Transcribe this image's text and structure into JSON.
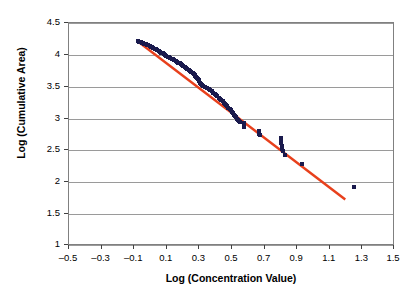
{
  "chart_data": {
    "type": "scatter",
    "title": "",
    "xlabel": "Log (Concentration Value)",
    "ylabel": "Log (Cumulative Area)",
    "xlim": [
      -0.5,
      1.5
    ],
    "ylim": [
      1,
      4.5
    ],
    "xticks": [
      "-0.5",
      "-0.3",
      "-0.1",
      "0.1",
      "0.3",
      "0.5",
      "0.7",
      "0.9",
      "1.1",
      "1.3",
      "1.5"
    ],
    "xtick_values": [
      -0.5,
      -0.3,
      -0.1,
      0.1,
      0.3,
      0.5,
      0.7,
      0.9,
      1.1,
      1.3,
      1.5
    ],
    "yticks": [
      "1",
      "1.5",
      "2",
      "2.5",
      "3",
      "3.5",
      "4",
      "4.5"
    ],
    "ytick_values": [
      1,
      1.5,
      2,
      2.5,
      3,
      3.5,
      4,
      4.5
    ],
    "grid": "horizontal",
    "legend": "none",
    "marker_color": "#1a1a4d",
    "trendline_color": "#e8401c",
    "series": [
      {
        "name": "Cumulative area vs concentration",
        "marker": "square",
        "points": [
          [
            -0.075,
            4.215
          ],
          [
            -0.068,
            4.205
          ],
          [
            -0.06,
            4.2
          ],
          [
            -0.052,
            4.19
          ],
          [
            -0.045,
            4.185
          ],
          [
            -0.038,
            4.175
          ],
          [
            -0.03,
            4.168
          ],
          [
            -0.022,
            4.16
          ],
          [
            -0.014,
            4.15
          ],
          [
            -0.006,
            4.14
          ],
          [
            0.002,
            4.13
          ],
          [
            0.01,
            4.118
          ],
          [
            0.018,
            4.105
          ],
          [
            0.026,
            4.095
          ],
          [
            0.034,
            4.085
          ],
          [
            0.042,
            4.07
          ],
          [
            0.05,
            4.058
          ],
          [
            0.058,
            4.045
          ],
          [
            0.066,
            4.035
          ],
          [
            0.074,
            4.022
          ],
          [
            0.082,
            4.01
          ],
          [
            0.09,
            3.998
          ],
          [
            0.098,
            3.985
          ],
          [
            0.106,
            3.972
          ],
          [
            0.114,
            3.96
          ],
          [
            0.122,
            3.95
          ],
          [
            0.13,
            3.94
          ],
          [
            0.138,
            3.928
          ],
          [
            0.146,
            3.915
          ],
          [
            0.154,
            3.902
          ],
          [
            0.162,
            3.89
          ],
          [
            0.17,
            3.878
          ],
          [
            0.178,
            3.865
          ],
          [
            0.186,
            3.852
          ],
          [
            0.194,
            3.84
          ],
          [
            0.202,
            3.828
          ],
          [
            0.21,
            3.812
          ],
          [
            0.218,
            3.798
          ],
          [
            0.226,
            3.782
          ],
          [
            0.234,
            3.768
          ],
          [
            0.242,
            3.752
          ],
          [
            0.25,
            3.738
          ],
          [
            0.258,
            3.722
          ],
          [
            0.264,
            3.705
          ],
          [
            0.27,
            3.69
          ],
          [
            0.276,
            3.672
          ],
          [
            0.282,
            3.655
          ],
          [
            0.288,
            3.638
          ],
          [
            0.292,
            3.62
          ],
          [
            0.296,
            3.6
          ],
          [
            0.3,
            3.582
          ],
          [
            0.304,
            3.562
          ],
          [
            0.308,
            3.545
          ],
          [
            0.314,
            3.528
          ],
          [
            0.322,
            3.512
          ],
          [
            0.332,
            3.498
          ],
          [
            0.344,
            3.482
          ],
          [
            0.356,
            3.465
          ],
          [
            0.368,
            3.448
          ],
          [
            0.378,
            3.428
          ],
          [
            0.386,
            3.408
          ],
          [
            0.394,
            3.388
          ],
          [
            0.402,
            3.368
          ],
          [
            0.41,
            3.348
          ],
          [
            0.418,
            3.33
          ],
          [
            0.426,
            3.312
          ],
          [
            0.434,
            3.292
          ],
          [
            0.442,
            3.272
          ],
          [
            0.45,
            3.252
          ],
          [
            0.456,
            3.232
          ],
          [
            0.462,
            3.212
          ],
          [
            0.47,
            3.192
          ],
          [
            0.478,
            3.172
          ],
          [
            0.486,
            3.15
          ],
          [
            0.494,
            3.128
          ],
          [
            0.5,
            3.105
          ],
          [
            0.506,
            3.082
          ],
          [
            0.512,
            3.06
          ],
          [
            0.518,
            3.04
          ],
          [
            0.524,
            3.02
          ],
          [
            0.53,
            3.0
          ],
          [
            0.536,
            2.982
          ],
          [
            0.542,
            2.965
          ],
          [
            0.548,
            2.948
          ],
          [
            0.572,
            2.932
          ],
          [
            0.572,
            2.91
          ],
          [
            0.574,
            2.89
          ],
          [
            0.576,
            2.87
          ],
          [
            0.664,
            2.805
          ],
          [
            0.666,
            2.782
          ],
          [
            0.668,
            2.758
          ],
          [
            0.67,
            2.735
          ],
          [
            0.8,
            2.69
          ],
          [
            0.8,
            2.65
          ],
          [
            0.802,
            2.61
          ],
          [
            0.804,
            2.565
          ],
          [
            0.806,
            2.525
          ],
          [
            0.812,
            2.498
          ],
          [
            0.826,
            2.43
          ],
          [
            0.93,
            2.282
          ],
          [
            1.248,
            1.93
          ]
        ]
      }
    ],
    "trendline": {
      "type": "linear",
      "start": [
        -0.085,
        4.225
      ],
      "end": [
        1.195,
        1.73
      ]
    }
  }
}
